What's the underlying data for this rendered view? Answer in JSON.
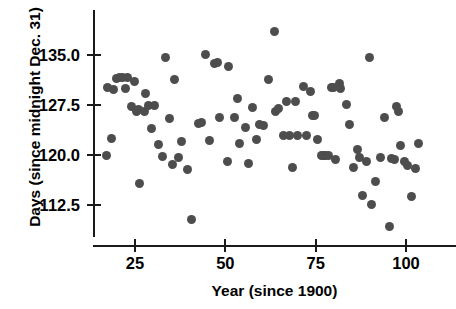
{
  "chart_data": {
    "type": "scatter",
    "title": "",
    "xlabel": "Year (since 1900)",
    "ylabel": "Days (since midnight Dec. 31)",
    "xlim": [
      16,
      108
    ],
    "ylim": [
      108.5,
      139.5
    ],
    "xticks": [
      25,
      50,
      75,
      100
    ],
    "xtick_labels": [
      "25",
      "50",
      "75",
      "100"
    ],
    "yticks": [
      112.5,
      120.0,
      127.5,
      135.0
    ],
    "ytick_labels": [
      "112.5",
      "120.0",
      "127.5",
      "135.0"
    ],
    "grid": false,
    "legend": null,
    "marker": {
      "shape": "circle",
      "color": "#4d4d4d",
      "size": 9
    },
    "series": [
      {
        "name": "Ice breakup date",
        "points": [
          [
            17.0,
            119.9
          ],
          [
            17.5,
            130.2
          ],
          [
            18.5,
            122.5
          ],
          [
            19.0,
            129.8
          ],
          [
            20.0,
            131.5
          ],
          [
            20.8,
            131.6
          ],
          [
            21.5,
            131.6
          ],
          [
            22.3,
            130.0
          ],
          [
            23.0,
            131.6
          ],
          [
            24.0,
            127.3
          ],
          [
            24.8,
            131.1
          ],
          [
            25.5,
            126.6
          ],
          [
            26.0,
            126.9
          ],
          [
            26.3,
            115.8
          ],
          [
            27.5,
            126.5
          ],
          [
            28.0,
            129.2
          ],
          [
            28.8,
            127.4
          ],
          [
            29.5,
            124.0
          ],
          [
            30.5,
            127.5
          ],
          [
            31.5,
            121.6
          ],
          [
            32.5,
            119.8
          ],
          [
            33.5,
            134.7
          ],
          [
            34.5,
            125.5
          ],
          [
            35.5,
            118.6
          ],
          [
            36.0,
            131.3
          ],
          [
            37.0,
            119.6
          ],
          [
            38.0,
            122.0
          ],
          [
            39.5,
            117.9
          ],
          [
            40.5,
            110.3
          ],
          [
            42.5,
            124.8
          ],
          [
            43.5,
            124.9
          ],
          [
            44.5,
            135.1
          ],
          [
            45.5,
            122.2
          ],
          [
            47.0,
            133.8
          ],
          [
            47.8,
            133.9
          ],
          [
            48.5,
            125.6
          ],
          [
            50.5,
            119.0
          ],
          [
            51.0,
            133.3
          ],
          [
            52.5,
            125.6
          ],
          [
            53.5,
            128.5
          ],
          [
            54.0,
            121.8
          ],
          [
            55.5,
            124.2
          ],
          [
            56.5,
            118.7
          ],
          [
            57.5,
            127.2
          ],
          [
            58.5,
            122.3
          ],
          [
            59.5,
            124.6
          ],
          [
            60.5,
            124.4
          ],
          [
            62.0,
            131.3
          ],
          [
            63.5,
            138.6
          ],
          [
            64.0,
            126.6
          ],
          [
            64.8,
            127.0
          ],
          [
            66.0,
            123.0
          ],
          [
            67.0,
            128.1
          ],
          [
            67.8,
            123.0
          ],
          [
            68.5,
            118.1
          ],
          [
            69.5,
            128.0
          ],
          [
            70.0,
            122.9
          ],
          [
            71.5,
            130.3
          ],
          [
            72.5,
            123.0
          ],
          [
            73.5,
            129.6
          ],
          [
            74.0,
            126.0
          ],
          [
            74.8,
            125.9
          ],
          [
            75.5,
            122.4
          ],
          [
            76.5,
            119.9
          ],
          [
            77.2,
            119.9
          ],
          [
            77.8,
            119.9
          ],
          [
            78.5,
            119.9
          ],
          [
            79.5,
            130.1
          ],
          [
            80.0,
            130.2
          ],
          [
            80.5,
            119.3
          ],
          [
            81.5,
            130.7
          ],
          [
            82.0,
            130.0
          ],
          [
            83.5,
            127.6
          ],
          [
            84.5,
            124.6
          ],
          [
            85.5,
            118.2
          ],
          [
            86.5,
            120.8
          ],
          [
            87.0,
            119.6
          ],
          [
            88.0,
            113.9
          ],
          [
            89.0,
            119.1
          ],
          [
            89.8,
            134.6
          ],
          [
            90.5,
            112.6
          ],
          [
            91.5,
            116.0
          ],
          [
            93.0,
            119.7
          ],
          [
            94.0,
            125.7
          ],
          [
            95.5,
            109.3
          ],
          [
            96.0,
            119.5
          ],
          [
            96.8,
            119.4
          ],
          [
            97.5,
            127.3
          ],
          [
            97.8,
            126.6
          ],
          [
            98.5,
            121.5
          ],
          [
            99.5,
            119.1
          ],
          [
            100.5,
            118.5
          ],
          [
            101.5,
            113.8
          ],
          [
            102.5,
            118.0
          ],
          [
            103.5,
            121.8
          ]
        ]
      }
    ]
  }
}
